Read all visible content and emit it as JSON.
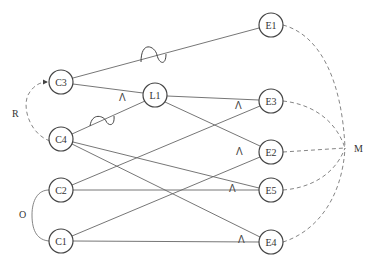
{
  "diagram": {
    "nodes": [
      {
        "id": "C3",
        "label": "C3",
        "x": 61,
        "y": 82
      },
      {
        "id": "C4",
        "label": "C4",
        "x": 61,
        "y": 139
      },
      {
        "id": "C2",
        "label": "C2",
        "x": 61,
        "y": 190
      },
      {
        "id": "C1",
        "label": "C1",
        "x": 61,
        "y": 241
      },
      {
        "id": "L1",
        "label": "L1",
        "x": 155,
        "y": 95
      },
      {
        "id": "E1",
        "label": "E1",
        "x": 271,
        "y": 25
      },
      {
        "id": "E3",
        "label": "E3",
        "x": 271,
        "y": 101
      },
      {
        "id": "E2",
        "label": "E2",
        "x": 271,
        "y": 152
      },
      {
        "id": "E5",
        "label": "E5",
        "x": 271,
        "y": 190
      },
      {
        "id": "E4",
        "label": "E4",
        "x": 271,
        "y": 242
      }
    ],
    "edges": [
      {
        "from": "C3",
        "to": "E1",
        "style": "solid",
        "marker": "wave"
      },
      {
        "from": "C3",
        "to": "L1",
        "style": "solid",
        "marker": "wedge"
      },
      {
        "from": "C4",
        "to": "L1",
        "style": "solid",
        "marker": "wave"
      },
      {
        "from": "L1",
        "to": "E3",
        "style": "solid"
      },
      {
        "from": "L1",
        "to": "E2",
        "style": "solid"
      },
      {
        "from": "C2",
        "to": "E3",
        "style": "solid",
        "marker": "wedge"
      },
      {
        "from": "C4",
        "to": "E5",
        "style": "solid",
        "marker": "wedge"
      },
      {
        "from": "C4",
        "to": "E4",
        "style": "solid",
        "marker": "wedge"
      },
      {
        "from": "C2",
        "to": "E5",
        "style": "solid"
      },
      {
        "from": "C1",
        "to": "E2",
        "style": "solid",
        "marker": "wedge"
      },
      {
        "from": "C1",
        "to": "E4",
        "style": "solid"
      }
    ],
    "groups": [
      {
        "label": "R",
        "members": [
          "C4",
          "C3"
        ],
        "style": "dashed-arrow",
        "x": 17,
        "y": 113
      },
      {
        "label": "O",
        "members": [
          "C2",
          "C1"
        ],
        "style": "solid-curve",
        "x": 23,
        "y": 214
      },
      {
        "label": "M",
        "members": [
          "E1",
          "E3",
          "E2",
          "E5",
          "E4"
        ],
        "style": "dashed-converge",
        "x": 358,
        "y": 149
      }
    ],
    "wedge_symbol": "Λ"
  }
}
